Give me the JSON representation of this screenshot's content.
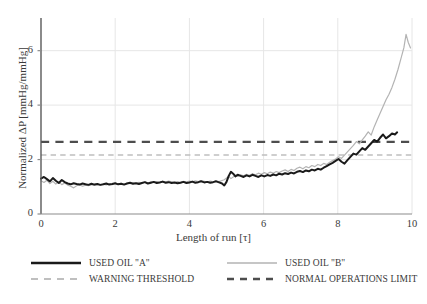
{
  "chart_data": {
    "type": "line",
    "title": "",
    "xlabel": "Length of run [τ]",
    "ylabel": "Normalized ΔP [mmHg/mmHg]",
    "xlim": [
      0,
      10
    ],
    "ylim": [
      0,
      7.2
    ],
    "xticks": [
      0,
      2,
      4,
      6,
      8,
      10
    ],
    "yticks": [
      0,
      2,
      4,
      6
    ],
    "xtick_labels": [
      "0",
      "2",
      "4",
      "6",
      "8",
      "10"
    ],
    "ytick_labels": [
      "0",
      "2",
      "4",
      "6"
    ],
    "grid": true,
    "grid_color": "#e6e6e6",
    "legend_position": "bottom",
    "series": [
      {
        "name": "USED OIL \"A\"",
        "style": "solid",
        "color": "#1a1a1a",
        "width": 2.0,
        "x": [
          0.0,
          0.08,
          0.16,
          0.24,
          0.32,
          0.4,
          0.48,
          0.56,
          0.64,
          0.72,
          0.8,
          0.88,
          0.96,
          1.04,
          1.12,
          1.2,
          1.28,
          1.36,
          1.44,
          1.52,
          1.6,
          1.68,
          1.76,
          1.84,
          1.92,
          2.0,
          2.08,
          2.16,
          2.24,
          2.32,
          2.4,
          2.48,
          2.56,
          2.64,
          2.72,
          2.8,
          2.88,
          2.96,
          3.04,
          3.12,
          3.2,
          3.28,
          3.36,
          3.44,
          3.52,
          3.6,
          3.68,
          3.76,
          3.84,
          3.92,
          4.0,
          4.08,
          4.16,
          4.24,
          4.32,
          4.4,
          4.48,
          4.56,
          4.64,
          4.72,
          4.8,
          4.88,
          4.94,
          5.0,
          5.06,
          5.12,
          5.18,
          5.24,
          5.3,
          5.38,
          5.46,
          5.54,
          5.62,
          5.7,
          5.78,
          5.86,
          5.94,
          6.02,
          6.1,
          6.18,
          6.26,
          6.34,
          6.42,
          6.5,
          6.58,
          6.66,
          6.74,
          6.82,
          6.9,
          6.98,
          7.06,
          7.14,
          7.22,
          7.3,
          7.38,
          7.46,
          7.54,
          7.62,
          7.7,
          7.78,
          7.86,
          7.94,
          8.02,
          8.1,
          8.18,
          8.26,
          8.34,
          8.42,
          8.5,
          8.58,
          8.66,
          8.74,
          8.82,
          8.9,
          8.98,
          9.06,
          9.14,
          9.22,
          9.3,
          9.38,
          9.46,
          9.54,
          9.6
        ],
        "y": [
          1.3,
          1.36,
          1.28,
          1.2,
          1.32,
          1.22,
          1.14,
          1.25,
          1.17,
          1.12,
          1.09,
          1.13,
          1.1,
          1.08,
          1.12,
          1.09,
          1.07,
          1.11,
          1.08,
          1.1,
          1.07,
          1.09,
          1.12,
          1.08,
          1.1,
          1.13,
          1.09,
          1.11,
          1.08,
          1.12,
          1.15,
          1.11,
          1.13,
          1.1,
          1.14,
          1.17,
          1.12,
          1.15,
          1.18,
          1.14,
          1.16,
          1.19,
          1.15,
          1.17,
          1.14,
          1.16,
          1.13,
          1.15,
          1.18,
          1.14,
          1.16,
          1.19,
          1.15,
          1.17,
          1.2,
          1.16,
          1.18,
          1.15,
          1.17,
          1.2,
          1.16,
          1.12,
          1.05,
          1.18,
          1.4,
          1.55,
          1.48,
          1.38,
          1.44,
          1.4,
          1.36,
          1.42,
          1.38,
          1.44,
          1.4,
          1.36,
          1.42,
          1.38,
          1.43,
          1.4,
          1.45,
          1.42,
          1.48,
          1.45,
          1.5,
          1.47,
          1.52,
          1.49,
          1.55,
          1.58,
          1.54,
          1.6,
          1.57,
          1.63,
          1.6,
          1.66,
          1.63,
          1.7,
          1.76,
          1.82,
          1.88,
          1.95,
          2.02,
          1.92,
          1.85,
          1.98,
          2.1,
          2.22,
          2.18,
          2.3,
          2.42,
          2.36,
          2.48,
          2.6,
          2.72,
          2.66,
          2.8,
          2.92,
          2.78,
          2.86,
          2.96,
          2.92,
          3.0
        ]
      },
      {
        "name": "USED OIL \"B\"",
        "style": "solid",
        "color": "#b3b3b3",
        "width": 1.2,
        "x": [
          0.0,
          0.08,
          0.16,
          0.24,
          0.32,
          0.4,
          0.48,
          0.56,
          0.64,
          0.72,
          0.8,
          0.88,
          0.96,
          1.04,
          1.12,
          1.2,
          1.28,
          1.36,
          1.44,
          1.52,
          1.6,
          1.68,
          1.76,
          1.84,
          1.92,
          2.0,
          2.08,
          2.16,
          2.24,
          2.32,
          2.4,
          2.48,
          2.56,
          2.64,
          2.72,
          2.8,
          2.88,
          2.96,
          3.04,
          3.12,
          3.2,
          3.28,
          3.36,
          3.44,
          3.52,
          3.6,
          3.68,
          3.76,
          3.84,
          3.92,
          4.0,
          4.08,
          4.16,
          4.24,
          4.32,
          4.4,
          4.48,
          4.56,
          4.64,
          4.72,
          4.8,
          4.88,
          4.94,
          5.0,
          5.06,
          5.12,
          5.18,
          5.24,
          5.3,
          5.38,
          5.46,
          5.54,
          5.62,
          5.7,
          5.78,
          5.86,
          5.94,
          6.02,
          6.1,
          6.18,
          6.26,
          6.34,
          6.42,
          6.5,
          6.58,
          6.66,
          6.74,
          6.82,
          6.9,
          6.98,
          7.06,
          7.14,
          7.22,
          7.3,
          7.38,
          7.46,
          7.54,
          7.62,
          7.7,
          7.78,
          7.86,
          7.94,
          8.02,
          8.1,
          8.18,
          8.26,
          8.34,
          8.42,
          8.5,
          8.58,
          8.66,
          8.74,
          8.82,
          8.9,
          8.98,
          9.06,
          9.14,
          9.22,
          9.3,
          9.38,
          9.46,
          9.54,
          9.62,
          9.7,
          9.78,
          9.84,
          9.9,
          9.96
        ],
        "y": [
          1.22,
          1.16,
          1.24,
          1.12,
          1.2,
          1.1,
          1.18,
          1.08,
          1.14,
          1.06,
          1.02,
          0.96,
          1.04,
          1.08,
          1.02,
          1.06,
          1.04,
          1.08,
          1.05,
          1.09,
          1.06,
          1.1,
          1.07,
          1.11,
          1.08,
          1.12,
          1.09,
          1.13,
          1.1,
          1.14,
          1.11,
          1.15,
          1.12,
          1.16,
          1.13,
          1.17,
          1.14,
          1.18,
          1.15,
          1.19,
          1.16,
          1.2,
          1.17,
          1.21,
          1.18,
          1.15,
          1.19,
          1.16,
          1.2,
          1.17,
          1.21,
          1.18,
          1.22,
          1.19,
          1.23,
          1.2,
          1.17,
          1.21,
          1.18,
          1.22,
          1.19,
          1.23,
          1.26,
          1.32,
          1.38,
          1.3,
          1.36,
          1.42,
          1.38,
          1.44,
          1.4,
          1.46,
          1.42,
          1.48,
          1.44,
          1.5,
          1.46,
          1.52,
          1.48,
          1.54,
          1.5,
          1.56,
          1.52,
          1.58,
          1.62,
          1.56,
          1.64,
          1.6,
          1.68,
          1.72,
          1.66,
          1.74,
          1.7,
          1.78,
          1.74,
          1.82,
          1.78,
          1.86,
          1.82,
          1.9,
          1.96,
          2.02,
          2.1,
          2.04,
          2.16,
          2.28,
          2.4,
          2.52,
          2.66,
          2.58,
          2.72,
          2.86,
          3.02,
          2.9,
          3.2,
          3.45,
          3.7,
          3.95,
          4.2,
          4.4,
          4.65,
          4.95,
          5.3,
          5.7,
          6.1,
          6.6,
          6.3,
          6.1
        ]
      }
    ],
    "hlines": [
      {
        "name": "WARNING THRESHOLD",
        "value": 2.17,
        "style": "dashed",
        "color": "#bfbfbf",
        "width": 1.6
      },
      {
        "name": "NORMAL OPERATIONS LIMIT",
        "value": 2.65,
        "style": "dashed",
        "color": "#4d4d4d",
        "width": 2.4
      }
    ]
  },
  "axes": {
    "x_title": "Length of run [τ]",
    "y_title": "Normalized ΔP [mmHg/mmHg]",
    "x_ticks": [
      "0",
      "2",
      "4",
      "6",
      "8",
      "10"
    ],
    "y_ticks": [
      "0",
      "2",
      "4",
      "6"
    ]
  },
  "legend": {
    "items": [
      {
        "label": "USED OIL \"A\"",
        "kind": "solid",
        "color": "#1a1a1a",
        "thickness": 2.6
      },
      {
        "label": "USED OIL \"B\"",
        "kind": "solid",
        "color": "#b3b3b3",
        "thickness": 1.4
      },
      {
        "label": "WARNING THRESHOLD",
        "kind": "dashed",
        "color": "#bfbfbf",
        "thickness": 1.8
      },
      {
        "label": "NORMAL OPERATIONS LIMIT",
        "kind": "dashed",
        "color": "#4d4d4d",
        "thickness": 2.6
      }
    ]
  }
}
